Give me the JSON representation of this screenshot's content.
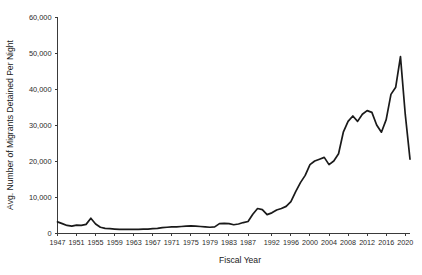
{
  "chart_data": {
    "type": "line",
    "title": "",
    "xlabel": "Fiscal Year",
    "ylabel": "Avg. Number of Migrants Detained Per Night",
    "xlim": [
      1947,
      2021
    ],
    "ylim": [
      0,
      60000
    ],
    "grid": false,
    "legend": "none",
    "y_ticks": [
      0,
      10000,
      20000,
      30000,
      40000,
      50000,
      60000
    ],
    "y_tick_labels": [
      "0",
      "10,000",
      "20,000",
      "30,000",
      "40,000",
      "50,000",
      "60,000"
    ],
    "x_tick_labels": [
      "1947",
      "1951",
      "1955",
      "1959",
      "1963",
      "1967",
      "1971",
      "1975",
      "1979",
      "1983",
      "1987",
      "1992",
      "1996",
      "2000",
      "2004",
      "2008",
      "2012",
      "2016",
      "2020"
    ],
    "series": [
      {
        "name": "Avg. Number of Migrants Detained Per Night",
        "color": "#1a1a1a",
        "x": [
          1947,
          1948,
          1949,
          1950,
          1951,
          1952,
          1953,
          1954,
          1955,
          1956,
          1957,
          1958,
          1959,
          1960,
          1961,
          1962,
          1963,
          1964,
          1965,
          1966,
          1967,
          1968,
          1969,
          1970,
          1971,
          1972,
          1973,
          1974,
          1975,
          1976,
          1977,
          1978,
          1979,
          1980,
          1981,
          1982,
          1983,
          1984,
          1985,
          1986,
          1987,
          1988,
          1989,
          1990,
          1991,
          1992,
          1993,
          1994,
          1995,
          1996,
          1997,
          1998,
          1999,
          2000,
          2001,
          2002,
          2003,
          2004,
          2005,
          2006,
          2007,
          2008,
          2009,
          2010,
          2011,
          2012,
          2013,
          2014,
          2015,
          2016,
          2017,
          2018,
          2019,
          2020,
          2021
        ],
        "values": [
          3100,
          2600,
          2100,
          1900,
          2200,
          2100,
          2400,
          4100,
          2500,
          1600,
          1300,
          1200,
          1100,
          1000,
          1000,
          1000,
          1000,
          1000,
          1100,
          1100,
          1200,
          1300,
          1500,
          1600,
          1700,
          1700,
          1800,
          1900,
          2000,
          1900,
          1800,
          1700,
          1600,
          1700,
          2600,
          2700,
          2600,
          2300,
          2500,
          2900,
          3200,
          5200,
          6800,
          6500,
          5100,
          5600,
          6400,
          6800,
          7400,
          8700,
          11500,
          14000,
          16000,
          19000,
          20000,
          20500,
          21000,
          19000,
          20000,
          22000,
          28000,
          31000,
          32500,
          31000,
          33000,
          34000,
          33500,
          30000,
          28000,
          31500,
          38500,
          40500,
          49000,
          33000,
          20500
        ]
      }
    ]
  },
  "axis": {
    "x_title": "Fiscal Year",
    "y_title": "Avg. Number of Migrants Detained Per Night"
  }
}
